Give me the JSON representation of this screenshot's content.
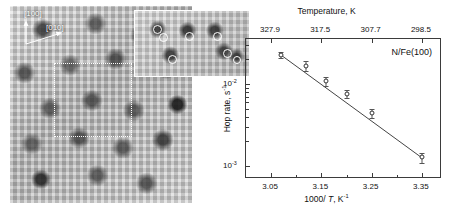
{
  "figure": {
    "stm": {
      "direction_label_1": "[100]",
      "direction_label_2": "[010]",
      "dotted_box_name": "inset-region-marker"
    }
  },
  "chart_data": {
    "type": "scatter",
    "title": "",
    "sample_label": "N/Fe(100)",
    "xlabel": "1000/ T, K-1",
    "xlabel_prefix": "1000/ ",
    "xlabel_italic": "T",
    "xlabel_suffix": ", K",
    "xlabel_exponent": "-1",
    "ylabel_prefix": "Hop rate, s",
    "ylabel_exponent": "-1",
    "top_axis_label": "Temperature, K",
    "xlim": [
      3.0,
      3.39
    ],
    "ylim": [
      0.0007,
      0.035
    ],
    "yscale": "log",
    "grid": false,
    "legend": "none",
    "xticks": [
      "3.05",
      "3.15",
      "3.25",
      "3.35"
    ],
    "xtick_values": [
      3.05,
      3.15,
      3.25,
      3.35
    ],
    "top_ticks": [
      "327.9",
      "317.5",
      "307.7",
      "298.5"
    ],
    "top_tick_values": [
      327.9,
      317.5,
      307.7,
      298.5
    ],
    "yticks": [
      "10",
      "10"
    ],
    "ytick_exponents": [
      "-2",
      "-3"
    ],
    "ytick_values": [
      0.01,
      0.001
    ],
    "x": [
      3.07,
      3.12,
      3.16,
      3.2,
      3.25,
      3.35
    ],
    "y": [
      0.0225,
      0.0165,
      0.0108,
      0.0076,
      0.0044,
      0.00128
    ],
    "yerr_low": [
      0.0018,
      0.0022,
      0.0014,
      0.0008,
      0.0006,
      0.00018
    ],
    "yerr_high": [
      0.0018,
      0.0022,
      0.0014,
      0.0008,
      0.0006,
      0.00018
    ],
    "marker": "open-circle",
    "fit_line": {
      "x_start": 3.066,
      "y_start": 0.0232,
      "x_end": 3.352,
      "y_end": 0.00124
    }
  }
}
